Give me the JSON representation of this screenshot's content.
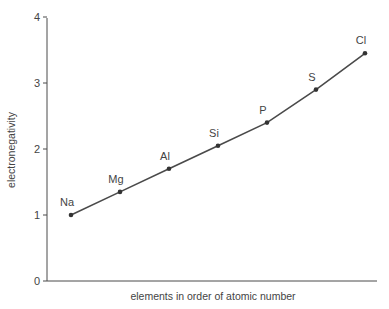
{
  "caption": "approximate values (Figure)",
  "chart_data": {
    "type": "line",
    "title": "",
    "xlabel": "elements in order of atomic number",
    "ylabel": "electronegativity",
    "categories": [
      "Na",
      "Mg",
      "Al",
      "Si",
      "P",
      "S",
      "Cl"
    ],
    "values": [
      1.0,
      1.35,
      1.7,
      2.05,
      2.4,
      2.9,
      3.45
    ],
    "yticks": [
      "0",
      "1",
      "2",
      "3",
      "4"
    ],
    "ylim": [
      0,
      4
    ],
    "grid": false,
    "legend": null,
    "marker": "dot",
    "line_color": "#4a4a4a"
  }
}
